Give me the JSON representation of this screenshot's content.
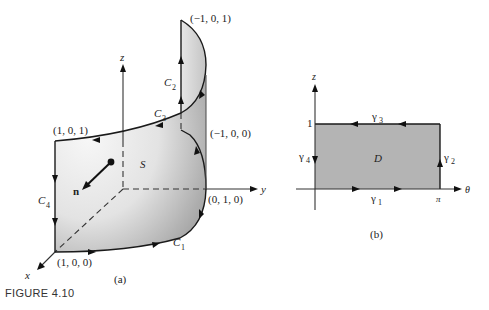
{
  "figure": {
    "caption": "FIGURE 4.10",
    "panel_a": {
      "label": "(a)",
      "axes": {
        "x": "x",
        "y": "y",
        "z": "z"
      },
      "surface_label": "S",
      "normal_label": "n",
      "curves": {
        "c1": "C",
        "c1_sub": "1",
        "c2": "C",
        "c2_sub": "2",
        "c3": "C",
        "c3_sub": "3",
        "c4": "C",
        "c4_sub": "4"
      },
      "points": {
        "p_top": "(−1, 0, 1)",
        "p_mid_right": "(−1, 0, 0)",
        "p_left_top": "(1, 0, 1)",
        "p_y": "(0, 1, 0)",
        "p_x": "(1, 0, 0)"
      }
    },
    "panel_b": {
      "label": "(b)",
      "axes": {
        "horizontal": "θ",
        "vertical": "z"
      },
      "region_label": "D",
      "tick_z": "1",
      "tick_theta": "π",
      "curves": {
        "g1": "γ",
        "g1_sub": "1",
        "g2": "γ",
        "g2_sub": "2",
        "g3": "γ",
        "g3_sub": "3",
        "g4": "γ",
        "g4_sub": "4"
      }
    },
    "colors": {
      "surface_light": "#f2f2f2",
      "surface_mid": "#c8c8c8",
      "surface_dark": "#8a8a8a",
      "region_fill": "#b4b4b4"
    }
  }
}
